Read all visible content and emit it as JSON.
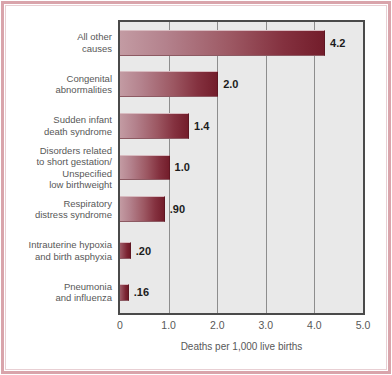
{
  "chart_data": {
    "type": "bar",
    "orientation": "horizontal",
    "title": "",
    "xlabel": "Deaths per 1,000 live births",
    "ylabel": "",
    "xlim": [
      0,
      5.0
    ],
    "xticks": [
      "0",
      "1.0",
      "2.0",
      "3.0",
      "4.0",
      "5.0"
    ],
    "xtick_values": [
      0,
      1.0,
      2.0,
      3.0,
      4.0,
      5.0
    ],
    "gridlines": [
      1.0,
      2.0,
      3.0,
      4.0
    ],
    "grid": true,
    "legend": "none",
    "categories": [
      "All other\ncauses",
      "Congenital\nabnormalities",
      "Sudden infant\ndeath syndrome",
      "Disorders related\nto short gestation/\nUnspecified\nlow birthweight",
      "Respiratory\ndistress syndrome",
      "Intrauterine hypoxia\nand birth asphyxia",
      "Pneumonia\nand influenza"
    ],
    "values": [
      4.2,
      2.0,
      1.4,
      1.0,
      0.9,
      0.2,
      0.16
    ],
    "value_labels": [
      "4.2",
      "2.0",
      "1.4",
      "1.0",
      ".90",
      ".20",
      ".16"
    ]
  },
  "style": {
    "bar_light": "#c39ba3",
    "bar_dark": "#731d2b",
    "plot_background": "#e9e9e9",
    "plot_border": "#4a4a4a",
    "gridline_color": "#8d8d8d",
    "frame_color": "#d9a4ab",
    "text_color": "#585858",
    "value_text_color": "#1c1c1c",
    "page_background": "#ffffff"
  }
}
